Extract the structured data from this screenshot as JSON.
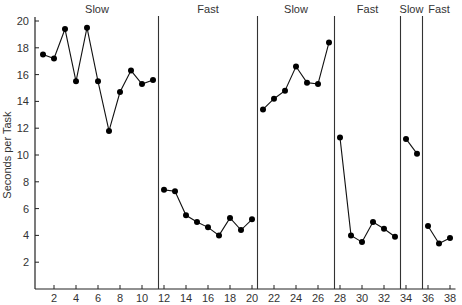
{
  "chart_data": {
    "type": "line",
    "title": "",
    "xlabel": "",
    "ylabel": "Seconds per Task",
    "xlim": [
      0,
      38.5
    ],
    "ylim": [
      0,
      20
    ],
    "x_ticks": [
      2,
      4,
      6,
      8,
      10,
      12,
      14,
      16,
      18,
      20,
      22,
      24,
      26,
      28,
      30,
      32,
      34,
      36,
      38
    ],
    "y_ticks": [
      2,
      4,
      6,
      8,
      10,
      12,
      14,
      16,
      18,
      20
    ],
    "grid": false,
    "legend": null,
    "phase_dividers": [
      11.5,
      20.5,
      27.5,
      33.5,
      35.5
    ],
    "phases": [
      {
        "label": "Slow",
        "start": 1,
        "end": 11
      },
      {
        "label": "Fast",
        "start": 12,
        "end": 20
      },
      {
        "label": "Slow",
        "start": 21,
        "end": 27
      },
      {
        "label": "Fast",
        "start": 28,
        "end": 33
      },
      {
        "label": "Slow",
        "start": 34,
        "end": 35
      },
      {
        "label": "Fast",
        "start": 36,
        "end": 38
      }
    ],
    "series": [
      {
        "name": "Slow 1",
        "x": [
          1,
          2,
          3,
          4,
          5,
          6,
          7,
          8,
          9,
          10,
          11
        ],
        "values": [
          17.5,
          17.2,
          19.4,
          15.5,
          19.5,
          15.5,
          11.8,
          14.7,
          16.3,
          15.3,
          15.6
        ]
      },
      {
        "name": "Fast 1",
        "x": [
          12,
          13,
          14,
          15,
          16,
          17,
          18,
          19,
          20
        ],
        "values": [
          7.4,
          7.3,
          5.5,
          5.0,
          4.6,
          4.0,
          5.3,
          4.4,
          5.2
        ]
      },
      {
        "name": "Slow 2",
        "x": [
          21,
          22,
          23,
          24,
          25,
          26,
          27
        ],
        "values": [
          13.4,
          14.2,
          14.8,
          16.6,
          15.4,
          15.3,
          18.4
        ]
      },
      {
        "name": "Fast 2",
        "x": [
          28,
          29,
          30,
          31,
          32,
          33
        ],
        "values": [
          11.3,
          4.0,
          3.5,
          5.0,
          4.5,
          3.9
        ]
      },
      {
        "name": "Slow 3",
        "x": [
          34,
          35
        ],
        "values": [
          11.2,
          10.1
        ]
      },
      {
        "name": "Fast 3",
        "x": [
          36,
          37,
          38
        ],
        "values": [
          4.7,
          3.4,
          3.8
        ]
      }
    ]
  }
}
